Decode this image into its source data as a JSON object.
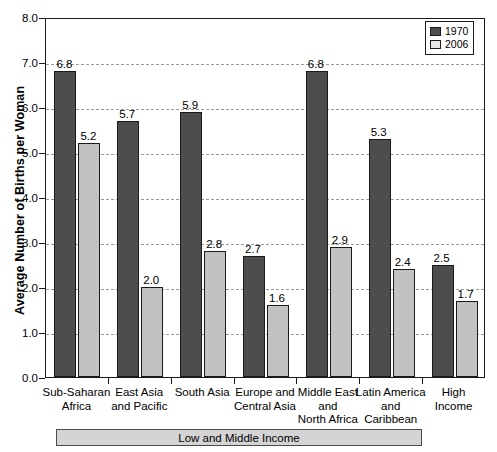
{
  "chart_data": {
    "type": "bar",
    "title": "",
    "xlabel": "",
    "ylabel": "Average Number of Births per Woman",
    "ylim": [
      0.0,
      8.0
    ],
    "ytick_labels": [
      "0.0",
      "1.0",
      "2.0",
      "3.0",
      "4.0",
      "5.0",
      "6.0",
      "7.0",
      "8.0"
    ],
    "grid": "horizontal dashed",
    "legend_position": "top-right",
    "categories": [
      "Sub-Saharan Africa",
      "East Asia and Pacific",
      "South Asia",
      "Europe and Central Asia",
      "Middle East and North Africa",
      "Latin America and Caribbean",
      "High Income"
    ],
    "category_label_lines": [
      [
        "Sub-Saharan",
        "Africa"
      ],
      [
        "East Asia",
        "and Pacific"
      ],
      [
        "South Asia"
      ],
      [
        "Europe and",
        "Central Asia"
      ],
      [
        "Middle East",
        "and",
        "North Africa"
      ],
      [
        "Latin America",
        "and",
        "Caribbean"
      ],
      [
        "High",
        "Income"
      ]
    ],
    "series": [
      {
        "name": "1970",
        "color": "#4d4d4d",
        "values": [
          6.8,
          5.7,
          5.9,
          2.7,
          6.8,
          5.3,
          2.5
        ]
      },
      {
        "name": "2006",
        "color": "#c2c2c2",
        "values": [
          5.2,
          2.0,
          2.8,
          1.6,
          2.9,
          2.4,
          1.7
        ]
      }
    ],
    "value_labels": {
      "1970": [
        "6.8",
        "5.7",
        "5.9",
        "2.7",
        "6.8",
        "5.3",
        "2.5"
      ],
      "2006": [
        "5.2",
        "2.0",
        "2.8",
        "1.6",
        "2.9",
        "2.4",
        "1.7"
      ]
    },
    "annotation_bracket": {
      "label": "Low and Middle Income",
      "spans_categories": [
        "Sub-Saharan Africa",
        "East Asia and Pacific",
        "South Asia",
        "Europe and Central Asia",
        "Middle East and North Africa",
        "Latin America and Caribbean"
      ]
    }
  },
  "legend": {
    "items": [
      {
        "label": "1970",
        "color": "#4d4d4d"
      },
      {
        "label": "2006",
        "color": "#e8e8e8"
      }
    ]
  }
}
